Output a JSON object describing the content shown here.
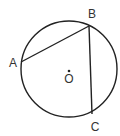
{
  "diagram": {
    "type": "circle-geometry",
    "circle": {
      "cx": 69,
      "cy": 69,
      "r": 48
    },
    "center": {
      "x": 69,
      "y": 71,
      "label": "O"
    },
    "points": [
      {
        "id": "A",
        "label": "A",
        "x": 21,
        "y": 62,
        "lx": 13,
        "ly": 67
      },
      {
        "id": "B",
        "label": "B",
        "x": 89,
        "y": 26,
        "lx": 92,
        "ly": 18
      },
      {
        "id": "C",
        "label": "C",
        "x": 92,
        "y": 114,
        "lx": 95,
        "ly": 131
      }
    ],
    "chords": [
      [
        "A",
        "B"
      ],
      [
        "B",
        "C"
      ]
    ],
    "stroke_color": "#222222"
  }
}
